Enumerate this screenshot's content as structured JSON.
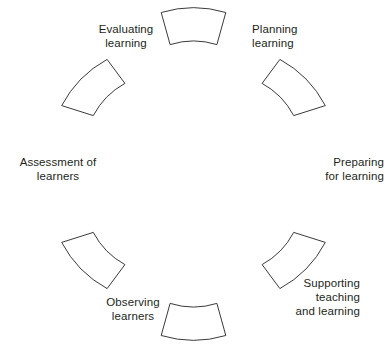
{
  "diagram": {
    "type": "cycle",
    "shape": "ring-of-arc-segments",
    "segment_count": 6,
    "background_color": "#ffffff",
    "stroke_color": "#3a3a3a",
    "fill_color": "#ffffff",
    "text_color": "#231f20",
    "stages": [
      {
        "id": "planning-learning",
        "position": "top-right",
        "label": "Planning\nlearning",
        "align": "left",
        "angle_deg": 30
      },
      {
        "id": "preparing-for-learning",
        "position": "right",
        "label": "Preparing\nfor learning",
        "align": "right",
        "angle_deg": 90
      },
      {
        "id": "supporting-teaching-and-learning",
        "position": "bottom-right",
        "label": "Supporting\nteaching\nand learning",
        "align": "right",
        "angle_deg": 150
      },
      {
        "id": "observing-learners",
        "position": "bottom-left",
        "label": "Observing\nlearners",
        "align": "center",
        "angle_deg": 210
      },
      {
        "id": "assessment-of-learners",
        "position": "left",
        "label": "Assessment of\nlearners",
        "align": "center",
        "angle_deg": 270
      },
      {
        "id": "evaluating-learning",
        "position": "top-left",
        "label": "Evaluating\nlearning",
        "align": "center",
        "angle_deg": 330
      }
    ]
  }
}
